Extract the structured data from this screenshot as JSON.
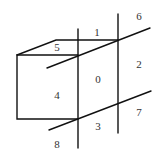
{
  "diagram": {
    "line_color": "#111111",
    "label_color": "#333333",
    "labels": [
      {
        "id": "1",
        "text": "1",
        "x": 97,
        "y": 33
      },
      {
        "id": "6",
        "text": "6",
        "x": 139,
        "y": 17
      },
      {
        "id": "5",
        "text": "5",
        "x": 57,
        "y": 48
      },
      {
        "id": "2",
        "text": "2",
        "x": 139,
        "y": 65
      },
      {
        "id": "0",
        "text": "0",
        "x": 98,
        "y": 80
      },
      {
        "id": "4",
        "text": "4",
        "x": 57,
        "y": 96
      },
      {
        "id": "7",
        "text": "7",
        "x": 139,
        "y": 113
      },
      {
        "id": "3",
        "text": "3",
        "x": 98,
        "y": 127
      },
      {
        "id": "8",
        "text": "8",
        "x": 57,
        "y": 145
      }
    ]
  }
}
